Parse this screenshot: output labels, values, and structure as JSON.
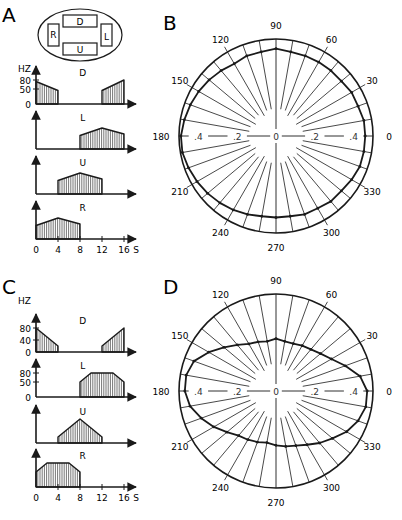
{
  "figure": {
    "panels": {
      "A": {
        "letter": "A"
      },
      "B": {
        "letter": "B"
      },
      "C": {
        "letter": "C"
      },
      "D": {
        "letter": "D"
      }
    },
    "electrode_diagram": {
      "labels": [
        "D",
        "R",
        "L",
        "U"
      ]
    },
    "caption_truncated": ""
  },
  "chart_data": [
    {
      "panel": "A",
      "type": "area",
      "title": "Stimulus frequency timing per electrode",
      "ylabel": "HZ",
      "xlabel": "S",
      "x_ticks": [
        0,
        4,
        8,
        12,
        16
      ],
      "y_ticks": [
        0,
        50,
        80
      ],
      "series": [
        {
          "name": "D",
          "points": [
            [
              0,
              75
            ],
            [
              4,
              45
            ],
            [
              4,
              0
            ],
            [
              12,
              0
            ],
            [
              12,
              45
            ],
            [
              16,
              80
            ]
          ]
        },
        {
          "name": "L",
          "points": [
            [
              8,
              45
            ],
            [
              12,
              70
            ],
            [
              16,
              50
            ],
            [
              16,
              0
            ],
            [
              8,
              0
            ]
          ]
        },
        {
          "name": "U",
          "points": [
            [
              4,
              45
            ],
            [
              8,
              70
            ],
            [
              12,
              50
            ],
            [
              12,
              0
            ],
            [
              4,
              0
            ]
          ]
        },
        {
          "name": "R",
          "points": [
            [
              0,
              45
            ],
            [
              4,
              70
            ],
            [
              8,
              50
            ],
            [
              8,
              0
            ],
            [
              0,
              0
            ]
          ]
        }
      ]
    },
    {
      "panel": "B",
      "type": "polar",
      "angle_ticks": [
        0,
        30,
        60,
        90,
        120,
        150,
        180,
        210,
        240,
        270,
        300,
        330
      ],
      "radial_ticks": [
        0,
        0.2,
        0.4
      ],
      "rmax": 0.5,
      "angles": [
        0,
        10,
        20,
        30,
        40,
        50,
        60,
        70,
        80,
        90,
        100,
        110,
        120,
        130,
        140,
        150,
        160,
        170,
        180,
        190,
        200,
        210,
        220,
        230,
        240,
        250,
        260,
        270,
        280,
        290,
        300,
        310,
        320,
        330,
        340,
        350
      ],
      "values": [
        0.46,
        0.46,
        0.45,
        0.45,
        0.44,
        0.44,
        0.44,
        0.44,
        0.44,
        0.45,
        0.44,
        0.44,
        0.43,
        0.44,
        0.45,
        0.46,
        0.47,
        0.48,
        0.49,
        0.49,
        0.48,
        0.47,
        0.46,
        0.45,
        0.44,
        0.43,
        0.42,
        0.42,
        0.42,
        0.43,
        0.43,
        0.44,
        0.44,
        0.45,
        0.46,
        0.46
      ]
    },
    {
      "panel": "C",
      "type": "area",
      "title": "Stimulus frequency timing per electrode",
      "ylabel": "HZ",
      "xlabel": "S",
      "x_ticks": [
        0,
        4,
        8,
        12,
        16
      ],
      "y_ticks_D": [
        0,
        40,
        80
      ],
      "y_ticks_L": [
        0,
        50,
        80
      ],
      "series": [
        {
          "name": "D",
          "points": [
            [
              0,
              80
            ],
            [
              4,
              20
            ],
            [
              4,
              0
            ],
            [
              12,
              0
            ],
            [
              12,
              20
            ],
            [
              16,
              80
            ]
          ]
        },
        {
          "name": "L",
          "points": [
            [
              8,
              50
            ],
            [
              10,
              80
            ],
            [
              14,
              80
            ],
            [
              16,
              50
            ],
            [
              16,
              0
            ],
            [
              8,
              0
            ]
          ]
        },
        {
          "name": "U",
          "points": [
            [
              4,
              20
            ],
            [
              8,
              80
            ],
            [
              12,
              20
            ],
            [
              12,
              0
            ],
            [
              4,
              0
            ]
          ]
        },
        {
          "name": "R",
          "points": [
            [
              0,
              50
            ],
            [
              2,
              80
            ],
            [
              6,
              80
            ],
            [
              8,
              50
            ],
            [
              8,
              0
            ],
            [
              0,
              0
            ]
          ]
        }
      ]
    },
    {
      "panel": "D",
      "type": "polar",
      "angle_ticks": [
        0,
        30,
        60,
        90,
        120,
        150,
        180,
        210,
        240,
        270,
        300,
        330
      ],
      "radial_ticks": [
        0,
        0.2,
        0.4
      ],
      "rmax": 0.5,
      "angles": [
        0,
        10,
        20,
        30,
        40,
        50,
        60,
        70,
        80,
        90,
        100,
        110,
        120,
        130,
        140,
        150,
        160,
        170,
        180,
        190,
        200,
        210,
        220,
        230,
        240,
        250,
        260,
        270,
        280,
        290,
        300,
        310,
        320,
        330,
        340,
        350
      ],
      "values": [
        0.47,
        0.44,
        0.38,
        0.33,
        0.3,
        0.28,
        0.27,
        0.26,
        0.26,
        0.27,
        0.26,
        0.27,
        0.28,
        0.31,
        0.35,
        0.4,
        0.45,
        0.47,
        0.47,
        0.45,
        0.41,
        0.37,
        0.33,
        0.3,
        0.29,
        0.28,
        0.27,
        0.28,
        0.29,
        0.3,
        0.32,
        0.35,
        0.38,
        0.42,
        0.45,
        0.47
      ]
    }
  ]
}
